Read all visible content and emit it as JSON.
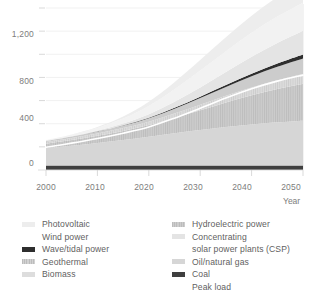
{
  "chart_data": {
    "type": "area",
    "title": "",
    "subtitle": "",
    "xlabel": "Year",
    "ylabel": "",
    "xlim": [
      2000,
      2050
    ],
    "ylim": [
      0,
      1400
    ],
    "x_ticks": [
      "2000",
      "2010",
      "2020",
      "2030",
      "2040",
      "2050"
    ],
    "x_tick_values": [
      2000,
      2010,
      2020,
      2030,
      2040,
      2050
    ],
    "y_ticks": [
      "0",
      "400",
      "800",
      "1,200"
    ],
    "y_tick_values": [
      0,
      400,
      800,
      1200
    ],
    "y_minor_ticks": [
      200,
      600,
      1000,
      1400
    ],
    "grid": true,
    "legend_position": "bottom",
    "stacked": true,
    "x": [
      2000,
      2005,
      2010,
      2015,
      2020,
      2025,
      2030,
      2035,
      2040,
      2045,
      2050
    ],
    "series": [
      {
        "name": "Coal",
        "color": "#3f3f3f",
        "values": [
          38,
          38,
          38,
          38,
          38,
          38,
          38,
          38,
          38,
          38,
          38
        ]
      },
      {
        "name": "Oil/natural gas",
        "color": "#d6d6d6",
        "values": [
          150,
          172,
          196,
          222,
          250,
          280,
          308,
          334,
          356,
          374,
          388
        ]
      },
      {
        "name": "Hydroelectric power",
        "color": "#c9c9c9",
        "values": [
          40,
          50,
          62,
          78,
          100,
          132,
          170,
          212,
          252,
          288,
          320
        ]
      },
      {
        "name": "Biomass",
        "color": "#dddddd",
        "values": [
          14,
          17,
          20,
          24,
          30,
          38,
          48,
          58,
          68,
          76,
          84
        ]
      },
      {
        "name": "Geothermal",
        "color": "#cccccc",
        "values": [
          10,
          13,
          17,
          22,
          30,
          42,
          58,
          76,
          96,
          116,
          134
        ]
      },
      {
        "name": "Wave/tidal power",
        "color": "#2e2e2e",
        "values": [
          0,
          0,
          1,
          2,
          4,
          7,
          11,
          16,
          22,
          28,
          34
        ]
      },
      {
        "name": "Concentrating solar power plants (CSP)",
        "color": "#e4e4e4",
        "values": [
          2,
          4,
          8,
          16,
          30,
          52,
          80,
          112,
          146,
          178,
          206
        ]
      },
      {
        "name": "Wind power",
        "color": "#f2f2f2",
        "values": [
          4,
          10,
          22,
          42,
          72,
          108,
          146,
          180,
          208,
          228,
          242
        ]
      },
      {
        "name": "Photovoltaic",
        "color": "#ededed",
        "values": [
          1,
          3,
          8,
          18,
          36,
          62,
          92,
          122,
          148,
          168,
          184
        ]
      }
    ],
    "annotations": [
      {
        "name": "Peak load",
        "type": "line",
        "color": "#ffffff",
        "values": [
          196,
          232,
          272,
          318,
          372,
          448,
          534,
          622,
          702,
          768,
          820
        ]
      }
    ]
  },
  "axes": {
    "y_labels": [
      "1,200",
      "800",
      "400",
      "0"
    ],
    "x_labels": [
      "2000",
      "2010",
      "2020",
      "2030",
      "2040",
      "2050"
    ],
    "x_axis_title": "Year"
  },
  "legend": {
    "left_column": [
      {
        "label": "Photovoltaic",
        "color": "#ededed",
        "swatch": true
      },
      {
        "label": "Wind power",
        "color": "#ffffff",
        "swatch": false
      },
      {
        "label": "Wave/tidal power",
        "color": "#2e2e2e",
        "swatch": true
      },
      {
        "label": "Geothermal",
        "color": "#cccccc",
        "swatch": true
      },
      {
        "label": "Biomass",
        "color": "#dddddd",
        "swatch": true
      }
    ],
    "right_column": [
      {
        "label": "Hydroelectric power",
        "color": "#c9c9c9",
        "swatch": true
      },
      {
        "label": "Concentrating",
        "color": "#e4e4e4",
        "swatch": true
      },
      {
        "label": "solar power plants (CSP)",
        "color": "#ffffff",
        "swatch": false
      },
      {
        "label": "Oil/natural gas",
        "color": "#d6d6d6",
        "swatch": true
      },
      {
        "label": "Coal",
        "color": "#3f3f3f",
        "swatch": true
      },
      {
        "label": "Peak load",
        "color": "#ffffff",
        "swatch": false
      }
    ]
  }
}
